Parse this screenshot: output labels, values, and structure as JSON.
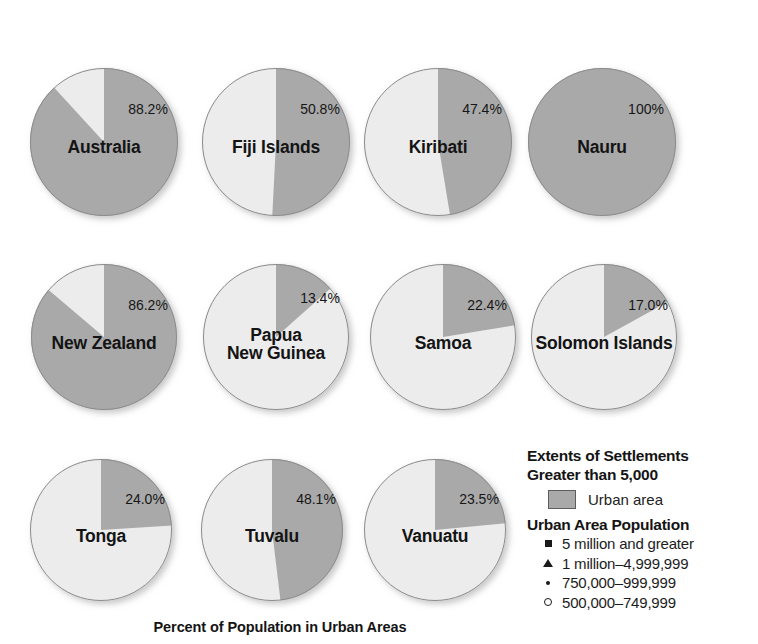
{
  "chart_data": {
    "type": "pie",
    "title": "Percent of Population in Urban Areas",
    "value_label_suffix": "%",
    "series_names": [
      "Urban area",
      "Rural area"
    ],
    "colors": {
      "urban": "#a9a9a9",
      "rural": "#ececec",
      "outline": "#8c8c8c",
      "text": "#141414",
      "background": "#ffffff"
    },
    "categories": [
      "Australia",
      "Fiji Islands",
      "Kiribati",
      "Nauru",
      "New Zealand",
      "Papua New Guinea",
      "Samoa",
      "Solomon Islands",
      "Tonga",
      "Tuvalu",
      "Vanuatu"
    ],
    "values": [
      88.2,
      50.8,
      47.4,
      100,
      86.2,
      13.4,
      22.4,
      17.0,
      24.0,
      48.1,
      23.5
    ],
    "pies": [
      {
        "name": "Australia",
        "label_lines": [
          "Australia"
        ],
        "value": 88.2,
        "value_text": "88.2%",
        "urban_pct": 88.2,
        "rural_pct": 11.8,
        "cx": 104,
        "cy": 142,
        "r": 74,
        "label_top": 138,
        "value_top": 102
      },
      {
        "name": "Fiji Islands",
        "label_lines": [
          "Fiji Islands"
        ],
        "value": 50.8,
        "value_text": "50.8%",
        "urban_pct": 50.8,
        "rural_pct": 49.2,
        "cx": 276,
        "cy": 142,
        "r": 74,
        "label_top": 138,
        "value_top": 102
      },
      {
        "name": "Kiribati",
        "label_lines": [
          "Kiribati"
        ],
        "value": 47.4,
        "value_text": "47.4%",
        "urban_pct": 47.4,
        "rural_pct": 52.6,
        "cx": 438,
        "cy": 142,
        "r": 74,
        "label_top": 138,
        "value_top": 102
      },
      {
        "name": "Nauru",
        "label_lines": [
          "Nauru"
        ],
        "value": 100,
        "value_text": "100%",
        "urban_pct": 100,
        "rural_pct": 0,
        "cx": 602,
        "cy": 142,
        "r": 74,
        "label_top": 138,
        "value_top": 102
      },
      {
        "name": "New Zealand",
        "label_lines": [
          "New Zealand"
        ],
        "value": 86.2,
        "value_text": "86.2%",
        "urban_pct": 86.2,
        "rural_pct": 13.8,
        "cx": 104,
        "cy": 337,
        "r": 73,
        "label_top": 334,
        "value_top": 298
      },
      {
        "name": "Papua New Guinea",
        "label_lines": [
          "Papua",
          "New Guinea"
        ],
        "value": 13.4,
        "value_text": "13.4%",
        "urban_pct": 13.4,
        "rural_pct": 86.6,
        "cx": 276,
        "cy": 337,
        "r": 73,
        "label_top": 326,
        "value_top": 291
      },
      {
        "name": "Samoa",
        "label_lines": [
          "Samoa"
        ],
        "value": 22.4,
        "value_text": "22.4%",
        "urban_pct": 22.4,
        "rural_pct": 77.6,
        "cx": 443,
        "cy": 337,
        "r": 73,
        "label_top": 334,
        "value_top": 298
      },
      {
        "name": "Solomon Islands",
        "label_lines": [
          "Solomon Islands"
        ],
        "value": 17.0,
        "value_text": "17.0%",
        "urban_pct": 17.0,
        "rural_pct": 83.0,
        "cx": 604,
        "cy": 337,
        "r": 73,
        "label_top": 334,
        "value_top": 298
      },
      {
        "name": "Tonga",
        "label_lines": [
          "Tonga"
        ],
        "value": 24.0,
        "value_text": "24.0%",
        "urban_pct": 24.0,
        "rural_pct": 76.0,
        "cx": 101,
        "cy": 530,
        "r": 71,
        "label_top": 527,
        "value_top": 492
      },
      {
        "name": "Tuvalu",
        "label_lines": [
          "Tuvalu"
        ],
        "value": 48.1,
        "value_text": "48.1%",
        "urban_pct": 48.1,
        "rural_pct": 51.9,
        "cx": 272,
        "cy": 530,
        "r": 71,
        "label_top": 527,
        "value_top": 492
      },
      {
        "name": "Vanuatu",
        "label_lines": [
          "Vanuatu"
        ],
        "value": 23.5,
        "value_text": "23.5%",
        "urban_pct": 23.5,
        "rural_pct": 76.5,
        "cx": 435,
        "cy": 530,
        "r": 71,
        "label_top": 527,
        "value_top": 492
      }
    ]
  },
  "caption": {
    "text": "Percent of Population in Urban Areas"
  },
  "legend": {
    "heading_line1": "Extents of Settlements",
    "heading_line2": "Greater than 5,000",
    "swatch_label": "Urban area",
    "swatch_color": "#a9a9a9",
    "population_heading": "Urban Area Population",
    "items": [
      {
        "marker": "filled-square-icon",
        "label": "5 million and greater"
      },
      {
        "marker": "filled-triangle-icon",
        "label": "1 million–4,999,999"
      },
      {
        "marker": "filled-dot-icon",
        "label": "750,000–999,999"
      },
      {
        "marker": "hollow-circle-icon",
        "label": "500,000–749,999"
      }
    ]
  }
}
